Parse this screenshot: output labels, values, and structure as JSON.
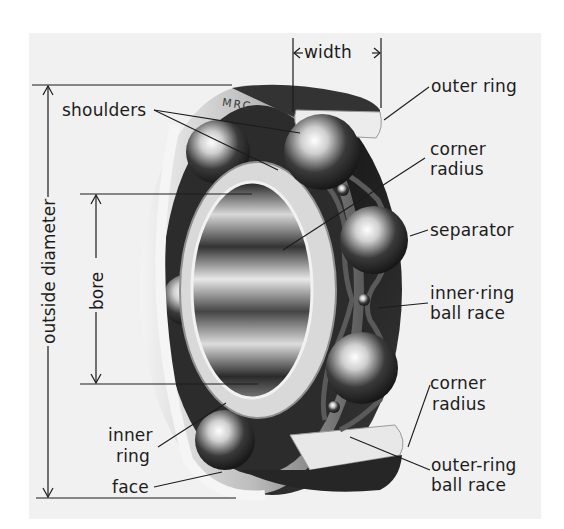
{
  "diagram": {
    "brand_mark": "MRC",
    "dimensions": {
      "width": "width",
      "outside_diameter": "outside diameter",
      "bore": "bore"
    },
    "labels": {
      "outer_ring": "outer ring",
      "shoulders": "shoulders",
      "corner_radius_top_1": "corner",
      "corner_radius_top_2": "radius",
      "separator": "separator",
      "inner_ring_ball_race_1": "inner·ring",
      "inner_ring_ball_race_2": "ball race",
      "corner_radius_bottom_1": "corner",
      "corner_radius_bottom_2": "radius",
      "inner_ring_1": "inner",
      "inner_ring_2": "ring",
      "face": "face",
      "outer_ring_ball_race_1": "outer-ring",
      "outer_ring_ball_race_2": "ball race"
    },
    "colors": {
      "panel": "#f1f1f1",
      "ink": "#1c1c1c",
      "steel_dark": "#2a2a2a",
      "steel_mid": "#8a8a8a",
      "steel_light": "#e6e6e6"
    }
  }
}
